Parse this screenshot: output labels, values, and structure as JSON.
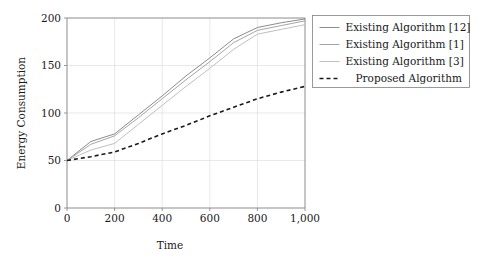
{
  "chart_data": {
    "type": "line",
    "title": "",
    "xlabel": "Time",
    "ylabel": "Energy Consumption",
    "xlim": [
      0,
      1000
    ],
    "ylim": [
      0,
      200
    ],
    "xticks": [
      0,
      200,
      400,
      600,
      800,
      1000
    ],
    "xtick_labels": [
      "0",
      "200",
      "400",
      "600",
      "800",
      "1,000"
    ],
    "yticks": [
      0,
      50,
      100,
      150,
      200
    ],
    "ytick_labels": [
      "0",
      "50",
      "100",
      "150",
      "200"
    ],
    "grid": true,
    "legend_position": "right-outside",
    "x": [
      0,
      100,
      200,
      300,
      400,
      500,
      600,
      700,
      800,
      900,
      1000
    ],
    "series": [
      {
        "name": "Existing Algorithm [12]",
        "label": "Existing Algorithm [12]",
        "color": "#8c8c8c",
        "style": "solid",
        "values": [
          50,
          70,
          78,
          98,
          118,
          139,
          158,
          178,
          190,
          195,
          199
        ]
      },
      {
        "name": "Existing Algorithm [1]",
        "label": "Existing Algorithm [1]",
        "color": "#a6a6a6",
        "style": "solid",
        "values": [
          50,
          67,
          76,
          95,
          115,
          135,
          154,
          174,
          187,
          192,
          197
        ]
      },
      {
        "name": "Existing Algorithm [3]",
        "label": "Existing Algorithm [3]",
        "color": "#c0c0c0",
        "style": "solid",
        "values": [
          50,
          61,
          68,
          88,
          108,
          128,
          147,
          167,
          183,
          188,
          193
        ]
      },
      {
        "name": "Proposed Algorithm",
        "label": "Proposed Algorithm",
        "color": "#1a1a1a",
        "style": "dashed",
        "values": [
          50,
          54,
          59,
          68,
          78,
          87,
          97,
          106,
          115,
          122,
          128
        ]
      }
    ]
  },
  "legend": {
    "entries": [
      {
        "label": "Existing Algorithm [12]"
      },
      {
        "label": "Existing Algorithm [1]"
      },
      {
        "label": "Existing Algorithm [3]"
      },
      {
        "label": "Proposed Algorithm"
      }
    ]
  },
  "colors": {
    "grid": "#d9d9d9",
    "axis": "#808080",
    "text": "#1a1a1a",
    "background": "#ffffff"
  }
}
